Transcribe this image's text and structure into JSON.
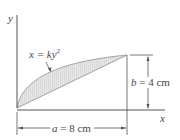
{
  "diagram": {
    "type": "area-between-curves",
    "axes": {
      "x_label": "x",
      "y_label": "y"
    },
    "curve": {
      "equation_lhs": "x = ",
      "equation_rhs": "ky",
      "exponent": "2"
    },
    "dimensions": {
      "a": {
        "symbol": "a",
        "text": " = 8 cm"
      },
      "b": {
        "symbol": "b",
        "text": " = 4 cm"
      }
    },
    "colors": {
      "line": "#555555",
      "fill": "#d9d9d9",
      "text": "#444444"
    }
  }
}
